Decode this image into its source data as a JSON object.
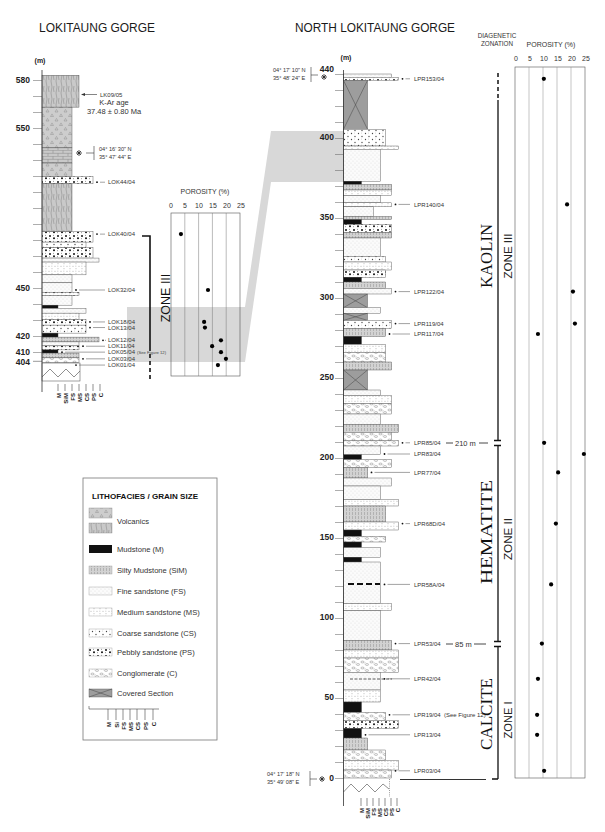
{
  "titles": {
    "left": "LOKITAUNG GORGE",
    "right": "NORTH LOKITAUNG GORGE",
    "zonation": [
      "DIAGENETIC",
      "ZONATION"
    ]
  },
  "lokitaung": {
    "unit": "(m)",
    "depth_labels": [
      "580",
      "550",
      "450",
      "420",
      "410",
      "404"
    ],
    "kar": {
      "sample": "LK09/05",
      "label": "K-Ar age",
      "value": "37.48 ± 0.80 Ma"
    },
    "coords": [
      "04° 16' 30\" N",
      "35° 47' 44\" E"
    ],
    "zone": "ZONE III",
    "porosity_title": "POROSITY (%)",
    "porosity_ticks": [
      "0",
      "5",
      "10",
      "15",
      "20",
      "25"
    ],
    "grain_scale": [
      "M",
      "SiM",
      "FS",
      "MS",
      "CS",
      "PS",
      "C"
    ],
    "samples": [
      {
        "id": "LOK44/04",
        "depth_m": 516
      },
      {
        "id": "LOK40/04",
        "depth_m": 483.5
      },
      {
        "id": "LOK32/04",
        "depth_m": 448.5
      },
      {
        "id": "LOK18/04",
        "depth_m": 428.5
      },
      {
        "id": "LOK13/04",
        "depth_m": 425
      },
      {
        "id": "LOK12/04",
        "depth_m": 417
      },
      {
        "id": "LOK11/04",
        "depth_m": 413.3
      },
      {
        "id": "LOK05/04",
        "depth_m": 409.6,
        "note": "(See Figure 12)"
      },
      {
        "id": "LOK03/04",
        "depth_m": 405.4
      },
      {
        "id": "LOK01/04",
        "depth_m": 401.5
      }
    ],
    "beds": [
      [
        583,
        563,
        "volcanic-hatch",
        "MS"
      ],
      [
        563,
        537.5,
        "volcanic-tri",
        "FS"
      ],
      [
        537.5,
        528,
        "volcanic-brick",
        "FS"
      ],
      [
        528,
        519.5,
        "volcanic-tri",
        "FS"
      ],
      [
        519.5,
        515,
        "pebbly",
        "PS"
      ],
      [
        515,
        485,
        "volcanic-hatch",
        "FS"
      ],
      [
        485,
        478.5,
        "pebbly",
        "PS"
      ],
      [
        478.5,
        475,
        "coarse",
        "CS"
      ],
      [
        475,
        468.5,
        "pebbly",
        "PS"
      ],
      [
        468.5,
        466,
        "fine",
        "C"
      ],
      [
        466,
        458,
        "medium",
        "CS"
      ],
      [
        458,
        453,
        "fine",
        "FS"
      ],
      [
        453,
        447,
        "fine",
        "FS"
      ],
      [
        447,
        445,
        "pebbly",
        "MS"
      ],
      [
        445,
        439,
        "fine",
        "FS"
      ],
      [
        439,
        437,
        "mud",
        "M"
      ],
      [
        437,
        434,
        "fine",
        "CS"
      ],
      [
        434,
        430,
        "medium",
        "MS"
      ],
      [
        430,
        426.5,
        "pebbly",
        "CS"
      ],
      [
        426.5,
        421.5,
        "coarse",
        "CS"
      ],
      [
        421.5,
        419,
        "mud",
        "M"
      ],
      [
        419,
        416,
        "silty",
        "C"
      ],
      [
        416,
        413.5,
        "fine",
        "MS"
      ],
      [
        413.5,
        411,
        "pebbly",
        "MS"
      ],
      [
        411,
        409,
        "mud",
        "M"
      ],
      [
        409,
        406,
        "silty",
        "MS"
      ],
      [
        406,
        403,
        "conglomerate",
        "MS"
      ]
    ]
  },
  "north_lokitaung": {
    "unit": "(m)",
    "depth_labels": [
      "440",
      "400",
      "350",
      "300",
      "250",
      "200",
      "150",
      "100",
      "50",
      "0"
    ],
    "coords_top": [
      "04° 17' 10\" N",
      "35° 48' 24\" E"
    ],
    "coords_base": [
      "04° 17' 18\" N",
      "35° 49' 08\" E"
    ],
    "grain_scale": [
      "M",
      "SiM",
      "FS",
      "MS",
      "CS",
      "PS",
      "C"
    ],
    "zone_boundaries": [
      {
        "label": "210 m"
      },
      {
        "label": "85 m"
      }
    ],
    "porosity_title": "POROSITY (%)",
    "porosity_ticks": [
      "0",
      "5",
      "10",
      "15",
      "20",
      "25"
    ],
    "samples": [
      {
        "id": "LPR153/04",
        "depth_m": 437
      },
      {
        "id": "LPR140/04",
        "depth_m": 358.5
      },
      {
        "id": "LPR122/04",
        "depth_m": 304
      },
      {
        "id": "LPR119/04",
        "depth_m": 284
      },
      {
        "id": "LPR117/04",
        "depth_m": 277.5
      },
      {
        "id": "LPR85/04",
        "depth_m": 209.5
      },
      {
        "id": "LPR83/04",
        "depth_m": 202.5
      },
      {
        "id": "LPR77/04",
        "depth_m": 191
      },
      {
        "id": "LPR68D/04",
        "depth_m": 159
      },
      {
        "id": "LPR58A/04",
        "depth_m": 121
      },
      {
        "id": "LPR53/04",
        "depth_m": 84
      },
      {
        "id": "LPR42/04",
        "depth_m": 62
      },
      {
        "id": "LPR19/04",
        "depth_m": 39.5,
        "note": "(See Figure 12)"
      },
      {
        "id": "LPR13/04",
        "depth_m": 27
      },
      {
        "id": "LPR03/04",
        "depth_m": 4.5
      }
    ],
    "beds": [
      [
        440,
        438,
        "fine",
        "PS"
      ],
      [
        438,
        436,
        "pebbly",
        "C"
      ],
      [
        436,
        405.5,
        "covered",
        "SiM"
      ],
      [
        405.5,
        395,
        "coarse",
        "CS"
      ],
      [
        395,
        393,
        "medium",
        "C"
      ],
      [
        393,
        373,
        "fine",
        "MS"
      ],
      [
        373,
        371,
        "mud",
        "M"
      ],
      [
        371,
        367.5,
        "silty",
        "PS"
      ],
      [
        367.5,
        364,
        "medium",
        "PS"
      ],
      [
        364,
        359.5,
        "fine",
        "MS"
      ],
      [
        359.5,
        357,
        "medium",
        "PS"
      ],
      [
        357,
        351,
        "fine",
        "FS"
      ],
      [
        351,
        349,
        "silty",
        "PS"
      ],
      [
        349,
        346,
        "mud",
        "M"
      ],
      [
        346,
        341,
        "pebbly",
        "PS"
      ],
      [
        341,
        337.5,
        "silty",
        "PS"
      ],
      [
        337.5,
        326,
        "fine",
        "MS"
      ],
      [
        326,
        322.5,
        "coarse",
        "CS"
      ],
      [
        322.5,
        317.5,
        "medium",
        "PS"
      ],
      [
        317.5,
        313,
        "pebbly",
        "CS"
      ],
      [
        313,
        310,
        "mud",
        "M"
      ],
      [
        310,
        306,
        "silty",
        "CS"
      ],
      [
        306,
        302.5,
        "fine",
        "PS"
      ],
      [
        302.5,
        294,
        "covered",
        "SiM"
      ],
      [
        294,
        290.5,
        "fine",
        "MS"
      ],
      [
        290.5,
        286,
        "covered",
        "SiM"
      ],
      [
        286,
        281,
        "coarse",
        "PS"
      ],
      [
        281,
        276,
        "silty",
        "CS"
      ],
      [
        276,
        271,
        "mud",
        "M"
      ],
      [
        271,
        266,
        "medium",
        "CS"
      ],
      [
        266,
        260,
        "conglomerate",
        "CS"
      ],
      [
        260,
        255,
        "silty",
        "PS"
      ],
      [
        255,
        242.5,
        "covered",
        "SiM"
      ],
      [
        242.5,
        239,
        "fine",
        "MS"
      ],
      [
        239,
        234,
        "medium",
        "PS"
      ],
      [
        234,
        227.5,
        "conglomerate",
        "PS"
      ],
      [
        227.5,
        221,
        "fine",
        "MS"
      ],
      [
        221,
        216,
        "silty",
        "C"
      ],
      [
        216,
        211,
        "conglomerate",
        "PS"
      ],
      [
        211,
        207.5,
        "conglomerate",
        "C"
      ],
      [
        207.5,
        202,
        "fine",
        "MS"
      ],
      [
        202,
        199,
        "mud",
        "M"
      ],
      [
        199,
        194,
        "conglomerate",
        "PS"
      ],
      [
        194,
        187.5,
        "silty",
        "SiM"
      ],
      [
        187.5,
        182.5,
        "fine",
        "PS"
      ],
      [
        182.5,
        174,
        "fine",
        "MS"
      ],
      [
        174,
        170,
        "medium",
        "C"
      ],
      [
        170,
        160,
        "silty",
        "CS"
      ],
      [
        160,
        155,
        "medium",
        "C"
      ],
      [
        155,
        151,
        "mud",
        "M"
      ],
      [
        151,
        147.5,
        "conglomerate",
        "CS"
      ],
      [
        147.5,
        144,
        "mud",
        "M"
      ],
      [
        144,
        138,
        "fine",
        "MS"
      ],
      [
        138,
        135,
        "mud",
        "M"
      ],
      [
        135,
        109,
        "fine",
        "MS"
      ],
      [
        109,
        104.5,
        "medium",
        "PS"
      ],
      [
        104.5,
        86,
        "fine",
        "MS"
      ],
      [
        86,
        80,
        "silty",
        "PS"
      ],
      [
        80,
        75,
        "medium",
        "C"
      ],
      [
        75,
        66,
        "conglomerate",
        "C"
      ],
      [
        66,
        55,
        "fine",
        "MS"
      ],
      [
        55,
        47.5,
        "medium",
        "MS"
      ],
      [
        47.5,
        41,
        "mud",
        "M"
      ],
      [
        41,
        36,
        "conglomerate",
        "CS"
      ],
      [
        36,
        31,
        "pebbly",
        "C"
      ],
      [
        31,
        25,
        "mud",
        "M"
      ],
      [
        25,
        17.5,
        "silty",
        "SiM"
      ],
      [
        17.5,
        11,
        "conglomerate",
        "CS"
      ],
      [
        11,
        5,
        "medium",
        "C"
      ],
      [
        5,
        0,
        "conglomerate",
        "PS"
      ]
    ]
  },
  "zonation": [
    {
      "mineral": "KAOLIN",
      "zone": "ZONE III"
    },
    {
      "mineral": "HEMATITE",
      "zone": "ZONE II"
    },
    {
      "mineral": "CALCITE",
      "zone": "ZONE I"
    }
  ],
  "legend": {
    "title": "LITHOFACIES / GRAIN SIZE",
    "items": [
      {
        "label": "Volcanics"
      },
      {
        "label": "Mudstone (M)"
      },
      {
        "label": "Silty Mudstone (SiM)"
      },
      {
        "label": "Fine sandstone (FS)"
      },
      {
        "label": "Medium sandstone (MS)"
      },
      {
        "label": "Coarse sandstone (CS)"
      },
      {
        "label": "Pebbly sandstone (PS)"
      },
      {
        "label": "Conglomerate (C)"
      },
      {
        "label": "Covered Section"
      }
    ],
    "scale": [
      "M",
      "Si",
      "FS",
      "MS",
      "CS",
      "PS",
      "C"
    ]
  },
  "chart_data": [
    {
      "type": "scatter",
      "section": "LOKITAUNG GORGE",
      "title": "POROSITY (%)",
      "xlabel": "POROSITY (%)",
      "ylabel": "(m)",
      "xlim": [
        0,
        25
      ],
      "xticks": [
        0,
        5,
        10,
        15,
        20,
        25
      ],
      "annotation": "ZONE III",
      "points": [
        {
          "sample": "LOK40/04",
          "depth_m": 483.5,
          "porosity": 3.6
        },
        {
          "sample": "LOK32/04",
          "depth_m": 448.5,
          "porosity": 13.4
        },
        {
          "sample": "LOK18/04",
          "depth_m": 428.5,
          "porosity": 12.0
        },
        {
          "sample": "LOK13/04",
          "depth_m": 425,
          "porosity": 12.3
        },
        {
          "sample": "LOK12/04",
          "depth_m": 417,
          "porosity": 18.1
        },
        {
          "sample": "LOK11/04",
          "depth_m": 413.3,
          "porosity": 14.9
        },
        {
          "sample": "LOK05/04",
          "depth_m": 409.6,
          "porosity": 18.1
        },
        {
          "sample": "LOK03/04",
          "depth_m": 405.4,
          "porosity": 19.9
        },
        {
          "sample": "LOK01/04",
          "depth_m": 401.5,
          "porosity": 17.0
        }
      ]
    },
    {
      "type": "scatter",
      "section": "NORTH LOKITAUNG GORGE",
      "title": "POROSITY (%)",
      "xlabel": "POROSITY (%)",
      "ylabel": "(m)",
      "xlim": [
        0,
        25
      ],
      "ylim": [
        0,
        440
      ],
      "xticks": [
        0,
        5,
        10,
        15,
        20,
        25
      ],
      "zones": [
        {
          "name": "ZONE III",
          "mineral": "KAOLIN",
          "from_m": 210,
          "to_m": 440
        },
        {
          "name": "ZONE II",
          "mineral": "HEMATITE",
          "from_m": 85,
          "to_m": 210
        },
        {
          "name": "ZONE I",
          "mineral": "CALCITE",
          "from_m": 0,
          "to_m": 85
        }
      ],
      "points": [
        {
          "sample": "LPR153/04",
          "depth_m": 437,
          "porosity": 10.3
        },
        {
          "sample": "LPR140/04",
          "depth_m": 358.5,
          "porosity": 18.6
        },
        {
          "sample": "LPR122/04",
          "depth_m": 304,
          "porosity": 20.7
        },
        {
          "sample": "LPR119/04",
          "depth_m": 284,
          "porosity": 21.4
        },
        {
          "sample": "LPR117/04",
          "depth_m": 277.5,
          "porosity": 8.2
        },
        {
          "sample": "LPR85/04",
          "depth_m": 209.5,
          "porosity": 10.4
        },
        {
          "sample": "LPR83/04",
          "depth_m": 202.5,
          "porosity": 24.6
        },
        {
          "sample": "LPR77/04",
          "depth_m": 191,
          "porosity": 15.4
        },
        {
          "sample": "LPR68D/04",
          "depth_m": 159,
          "porosity": 14.6
        },
        {
          "sample": "LPR58A/04",
          "depth_m": 121,
          "porosity": 12.9
        },
        {
          "sample": "LPR53/04",
          "depth_m": 84,
          "porosity": 9.6
        },
        {
          "sample": "LPR42/04",
          "depth_m": 62,
          "porosity": 8.2
        },
        {
          "sample": "LPR19/04",
          "depth_m": 39.5,
          "porosity": 7.9
        },
        {
          "sample": "LPR13/04",
          "depth_m": 27,
          "porosity": 7.9
        },
        {
          "sample": "LPR03/04",
          "depth_m": 4.5,
          "porosity": 10.4
        }
      ]
    }
  ]
}
